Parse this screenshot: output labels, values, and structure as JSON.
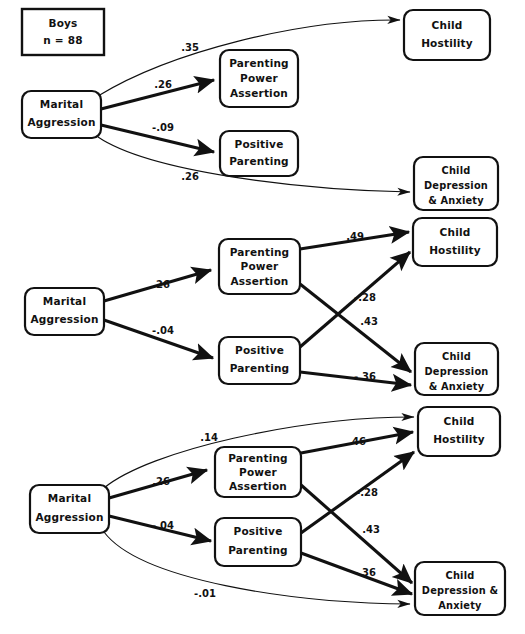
{
  "figure": {
    "type": "path-diagram",
    "title_box": {
      "line1": "Boys",
      "line2": "n = 88"
    }
  },
  "node_labels": {
    "marital_aggression": {
      "l1": "Marital",
      "l2": "Aggression"
    },
    "parenting_power_assertion": {
      "l1": "Parenting",
      "l2": "Power",
      "l3": "Assertion"
    },
    "positive_parenting": {
      "l1": "Positive",
      "l2": "Parenting"
    },
    "child_hostility": {
      "l1": "Child",
      "l2": "Hostility"
    },
    "child_depression_2line": {
      "l1": "Child",
      "l2": "Depression",
      "l3": "& Anxiety"
    },
    "child_depression_3line": {
      "l1": "Child",
      "l2": "Depression &",
      "l3": "Anxiety"
    }
  },
  "panels": [
    {
      "id": "panel-1",
      "label": "Boys n = 88 model",
      "coefficients": [
        {
          "id": "ma-to-ch",
          "value": ".35",
          "from": "marital-aggression",
          "to": "child-hostility",
          "style": "thin-curve"
        },
        {
          "id": "ma-to-ppa",
          "value": ".26",
          "from": "marital-aggression",
          "to": "parenting-power-assertion",
          "style": "thick"
        },
        {
          "id": "ma-to-pp",
          "value": "-.09",
          "from": "marital-aggression",
          "to": "positive-parenting",
          "style": "thick"
        },
        {
          "id": "ma-to-cda",
          "value": ".26",
          "from": "marital-aggression",
          "to": "child-depression-anxiety",
          "style": "thin-curve"
        }
      ]
    },
    {
      "id": "panel-2",
      "label": "Mediation model",
      "coefficients": [
        {
          "id": "ma-to-ppa",
          "value": ".26",
          "from": "marital-aggression",
          "to": "parenting-power-assertion",
          "style": "thick"
        },
        {
          "id": "ma-to-pp",
          "value": "-.04",
          "from": "marital-aggression",
          "to": "positive-parenting",
          "style": "thick"
        },
        {
          "id": "ppa-to-ch",
          "value": ".49",
          "from": "parenting-power-assertion",
          "to": "child-hostility",
          "style": "thick"
        },
        {
          "id": "ppa-to-cda",
          "value": "-.28",
          "from": "parenting-power-assertion",
          "to": "child-depression-anxiety",
          "style": "thick"
        },
        {
          "id": "pp-to-ch",
          "value": ".43",
          "from": "positive-parenting",
          "to": "child-hostility",
          "style": "thick"
        },
        {
          "id": "pp-to-cda",
          "value": "-.36",
          "from": "positive-parenting",
          "to": "child-depression-anxiety",
          "style": "thick"
        }
      ]
    },
    {
      "id": "panel-3",
      "label": "Full model with direct effects",
      "coefficients": [
        {
          "id": "ma-to-ch",
          "value": ".14",
          "from": "marital-aggression",
          "to": "child-hostility",
          "style": "thin-curve"
        },
        {
          "id": "ma-to-ppa",
          "value": ".26",
          "from": "marital-aggression",
          "to": "parenting-power-assertion",
          "style": "thick"
        },
        {
          "id": "ma-to-pp",
          "value": "-.04",
          "from": "marital-aggression",
          "to": "positive-parenting",
          "style": "thick"
        },
        {
          "id": "ma-to-cda",
          "value": "-.01",
          "from": "marital-aggression",
          "to": "child-depression-anxiety",
          "style": "thin-curve"
        },
        {
          "id": "ppa-to-ch",
          "value": ".46",
          "from": "parenting-power-assertion",
          "to": "child-hostility",
          "style": "thick"
        },
        {
          "id": "ppa-to-cda",
          "value": "-.28",
          "from": "parenting-power-assertion",
          "to": "child-depression-anxiety",
          "style": "thick"
        },
        {
          "id": "pp-to-ch",
          "value": ".43",
          "from": "positive-parenting",
          "to": "child-hostility",
          "style": "thick"
        },
        {
          "id": "pp-to-cda",
          "value": "-.36",
          "from": "positive-parenting",
          "to": "child-depression-anxiety",
          "style": "thick"
        }
      ]
    }
  ],
  "colors": {
    "ink": "#111111",
    "paper": "#ffffff"
  }
}
